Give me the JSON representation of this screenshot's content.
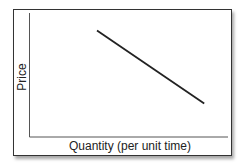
{
  "chart_data": {
    "type": "line",
    "title": "",
    "xlabel": "Quantity (per unit time)",
    "ylabel": "Price",
    "x_ticks": [],
    "y_ticks": [],
    "grid": false,
    "legend": null,
    "series": [
      {
        "name": "Demand",
        "description": "Downward-sloping straight line",
        "points": [
          {
            "x": 0.34,
            "y": 0.86
          },
          {
            "x": 0.88,
            "y": 0.27
          }
        ],
        "color": "#222222"
      }
    ],
    "xlim": [
      0,
      1
    ],
    "ylim": [
      0,
      1
    ]
  },
  "axes": {
    "x_label": "Quantity (per unit time)",
    "y_label": "Price"
  }
}
